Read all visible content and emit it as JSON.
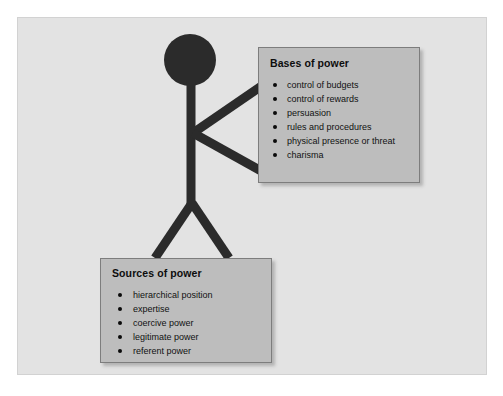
{
  "diagram": {
    "type": "concept-diagram",
    "background_color": "#ffffff",
    "frame_color": "#e3e3e3",
    "frame_border_color": "#d2d2d2",
    "figure": {
      "name": "stick-figure",
      "color": "#2b2b2b",
      "parts": [
        "head",
        "torso",
        "upper-arm",
        "lower-arm",
        "left-leg",
        "right-leg"
      ]
    },
    "box_fill_color": "#bdbdbd",
    "box_border_color": "#7d7d7d",
    "text_color": "#101010"
  },
  "bases_box": {
    "title": "Bases of power",
    "items": [
      "control of budgets",
      "control of rewards",
      "persuasion",
      "rules and procedures",
      "physical presence or threat",
      "charisma"
    ]
  },
  "sources_box": {
    "title": "Sources of power",
    "items": [
      "hierarchical position",
      "expertise",
      "coercive power",
      "legitimate power",
      "referent power"
    ]
  }
}
